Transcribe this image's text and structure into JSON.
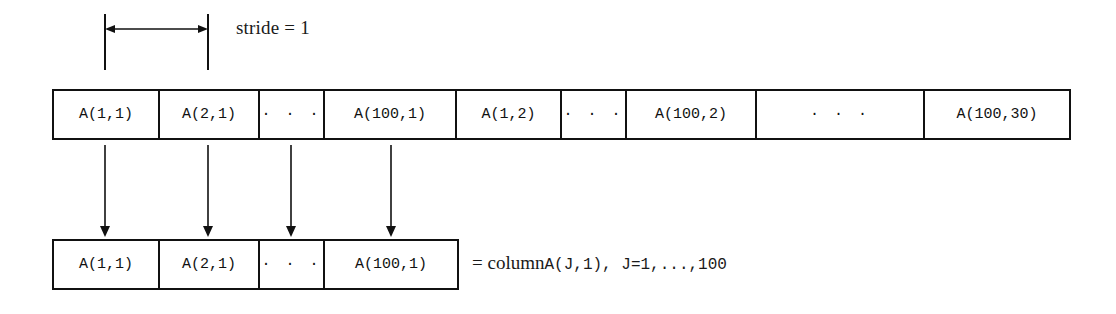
{
  "figure": {
    "background_color": "#ffffff",
    "line_color": "#111111"
  },
  "stride_annotation": {
    "label": "stride = 1",
    "arrow_type": "double-headed-horizontal",
    "span_from_cell": 0,
    "span_to_cell": 1
  },
  "memory_row": {
    "name": "linear-memory-layout",
    "cells": [
      {
        "text": "A(1,1)",
        "is_ellipsis": false,
        "width": 106
      },
      {
        "text": "A(2,1)",
        "is_ellipsis": false,
        "width": 100
      },
      {
        "text": "· · ·",
        "is_ellipsis": true,
        "width": 65
      },
      {
        "text": "A(100,1)",
        "is_ellipsis": false,
        "width": 132
      },
      {
        "text": "A(1,2)",
        "is_ellipsis": false,
        "width": 105
      },
      {
        "text": "· · ·",
        "is_ellipsis": true,
        "width": 65
      },
      {
        "text": "A(100,2)",
        "is_ellipsis": false,
        "width": 130
      },
      {
        "text": "· · ·",
        "is_ellipsis": true,
        "width": 168
      },
      {
        "text": "A(100,30)",
        "is_ellipsis": false,
        "width": 144
      }
    ]
  },
  "column_row": {
    "name": "extracted-column-layout",
    "cells": [
      {
        "text": "A(1,1)",
        "is_ellipsis": false,
        "width": 106
      },
      {
        "text": "A(2,1)",
        "is_ellipsis": false,
        "width": 100
      },
      {
        "text": "· · ·",
        "is_ellipsis": true,
        "width": 65
      },
      {
        "text": "A(100,1)",
        "is_ellipsis": false,
        "width": 132
      }
    ]
  },
  "mapping_arrows": {
    "count": 4,
    "direction": "down",
    "x_positions": [
      105,
      208,
      291,
      391
    ]
  },
  "caption": {
    "prefix": "= column ",
    "expression": "A(J,1), J=1,...,100"
  }
}
